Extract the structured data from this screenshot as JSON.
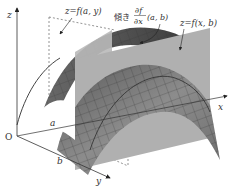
{
  "figure": {
    "axes": {
      "z_label": "z",
      "x_label": "x",
      "y_label": "y",
      "origin_label": "O"
    },
    "points": {
      "a_label": "a",
      "b_label": "b"
    },
    "annotations": {
      "curve_fay": "z=f(a, y)",
      "slope_prefix": "傾き",
      "slope_numerator": "∂f",
      "slope_denominator": "∂x",
      "slope_args": "(a, b)",
      "curve_fxb": "z=f(x, b)"
    },
    "colors": {
      "background": "#ffffff",
      "surface": "#8a8a8a",
      "surface_dark": "#5e5e5e",
      "surface_grid": "#3a3a3a",
      "plane": "#b4b4b4",
      "axis": "#333333",
      "dashed": "#666666"
    }
  }
}
